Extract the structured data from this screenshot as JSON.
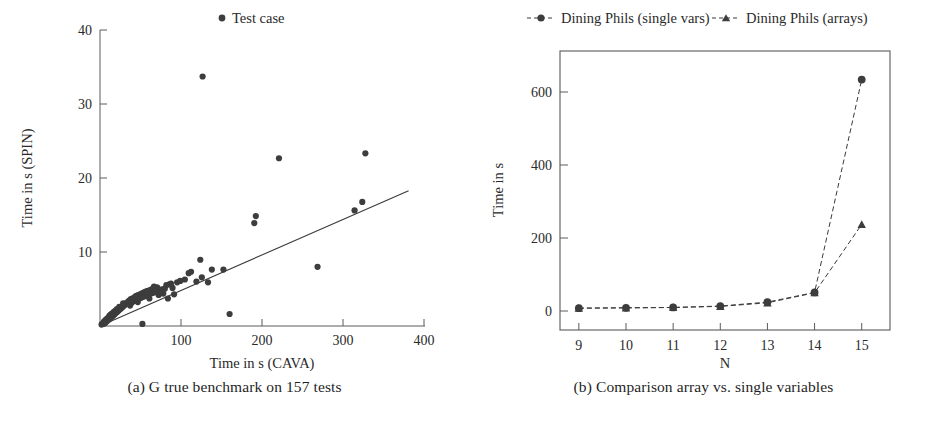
{
  "figure": {
    "subfigures": [
      {
        "caption": "(a) G true benchmark on 157 tests",
        "caption_tag": "(a)"
      },
      {
        "caption": "(b) Comparison array vs. single variables",
        "caption_tag": "(b)"
      }
    ]
  },
  "chart_data": [
    {
      "type": "scatter",
      "title": "",
      "xlabel": "Time in s (CAVA)",
      "ylabel": "Time in s (SPIN)",
      "xlim": [
        0,
        420
      ],
      "ylim": [
        0,
        42
      ],
      "xticks": [
        100,
        200,
        300,
        400
      ],
      "yticks": [
        10,
        20,
        30,
        40
      ],
      "grid": false,
      "legend_position": "top-center",
      "legend": [
        {
          "label": "Test case",
          "marker": "circle",
          "color": "#3d3d3d"
        }
      ],
      "trend_line": {
        "label": "regression line",
        "x": [
          0,
          400
        ],
        "y": [
          0,
          19.2
        ],
        "color": "#3a3a3a"
      },
      "series": [
        {
          "name": "Test case",
          "marker": "circle",
          "color": "#3d3d3d",
          "points": [
            [
              2,
              0.2
            ],
            [
              3,
              0.3
            ],
            [
              4,
              0.3
            ],
            [
              5,
              0.4
            ],
            [
              5,
              0.6
            ],
            [
              6,
              0.4
            ],
            [
              6,
              0.7
            ],
            [
              7,
              0.5
            ],
            [
              7,
              0.8
            ],
            [
              8,
              0.6
            ],
            [
              8,
              0.9
            ],
            [
              9,
              0.7
            ],
            [
              9,
              1.0
            ],
            [
              10,
              0.8
            ],
            [
              10,
              1.1
            ],
            [
              11,
              0.9
            ],
            [
              11,
              1.2
            ],
            [
              12,
              1.0
            ],
            [
              12,
              1.4
            ],
            [
              13,
              1.1
            ],
            [
              13,
              1.5
            ],
            [
              14,
              1.2
            ],
            [
              14,
              1.6
            ],
            [
              15,
              1.3
            ],
            [
              15,
              1.7
            ],
            [
              16,
              1.4
            ],
            [
              16,
              1.8
            ],
            [
              17,
              1.5
            ],
            [
              18,
              1.6
            ],
            [
              18,
              2.0
            ],
            [
              19,
              1.7
            ],
            [
              20,
              1.8
            ],
            [
              20,
              2.2
            ],
            [
              21,
              1.9
            ],
            [
              22,
              2.0
            ],
            [
              22,
              2.4
            ],
            [
              23,
              2.1
            ],
            [
              24,
              2.2
            ],
            [
              25,
              2.3
            ],
            [
              25,
              2.7
            ],
            [
              26,
              2.4
            ],
            [
              27,
              2.5
            ],
            [
              28,
              2.6
            ],
            [
              29,
              2.7
            ],
            [
              30,
              2.8
            ],
            [
              30,
              3.2
            ],
            [
              31,
              2.9
            ],
            [
              32,
              3.0
            ],
            [
              33,
              3.1
            ],
            [
              34,
              3.2
            ],
            [
              35,
              3.3
            ],
            [
              36,
              3.4
            ],
            [
              37,
              3.5
            ],
            [
              38,
              3.6
            ],
            [
              39,
              2.9
            ],
            [
              40,
              3.8
            ],
            [
              41,
              3.3
            ],
            [
              42,
              3.9
            ],
            [
              43,
              3.5
            ],
            [
              44,
              4.0
            ],
            [
              45,
              3.6
            ],
            [
              46,
              4.2
            ],
            [
              47,
              3.8
            ],
            [
              48,
              4.3
            ],
            [
              49,
              3.4
            ],
            [
              50,
              4.4
            ],
            [
              51,
              3.9
            ],
            [
              52,
              4.5
            ],
            [
              53,
              4.0
            ],
            [
              54,
              4.6
            ],
            [
              55,
              4.1
            ],
            [
              56,
              4.7
            ],
            [
              57,
              4.2
            ],
            [
              58,
              4.8
            ],
            [
              59,
              4.3
            ],
            [
              60,
              4.9
            ],
            [
              61,
              4.4
            ],
            [
              62,
              5.0
            ],
            [
              63,
              4.5
            ],
            [
              64,
              3.9
            ],
            [
              65,
              5.1
            ],
            [
              66,
              4.6
            ],
            [
              67,
              5.2
            ],
            [
              68,
              4.7
            ],
            [
              69,
              5.3
            ],
            [
              70,
              5.6
            ],
            [
              71,
              4.8
            ],
            [
              72,
              5.4
            ],
            [
              73,
              4.9
            ],
            [
              74,
              5.5
            ],
            [
              75,
              5.0
            ],
            [
              76,
              4.4
            ],
            [
              78,
              5.1
            ],
            [
              80,
              5.2
            ],
            [
              82,
              4.6
            ],
            [
              84,
              5.3
            ],
            [
              86,
              5.8
            ],
            [
              88,
              3.9
            ],
            [
              90,
              5.9
            ],
            [
              92,
              6.0
            ],
            [
              94,
              5.4
            ],
            [
              96,
              4.5
            ],
            [
              55,
              0.3
            ],
            [
              100,
              6.2
            ],
            [
              104,
              6.4
            ],
            [
              110,
              6.6
            ],
            [
              115,
              7.5
            ],
            [
              118,
              7.7
            ],
            [
              125,
              6.3
            ],
            [
              130,
              9.4
            ],
            [
              132,
              6.9
            ],
            [
              140,
              6.2
            ],
            [
              145,
              8.0
            ],
            [
              160,
              8.0
            ],
            [
              168,
              1.7
            ],
            [
              200,
              14.6
            ],
            [
              202,
              15.6
            ],
            [
              232,
              23.8
            ],
            [
              282,
              8.4
            ],
            [
              330,
              16.4
            ],
            [
              340,
              17.6
            ],
            [
              344,
              24.5
            ],
            [
              133,
              35.4
            ]
          ]
        }
      ]
    },
    {
      "type": "line",
      "title": "",
      "xlabel": "N",
      "ylabel": "Time in s",
      "x": [
        9,
        10,
        11,
        12,
        13,
        14,
        15
      ],
      "xticks": [
        9,
        10,
        11,
        12,
        13,
        14,
        15
      ],
      "yticks": [
        0,
        200,
        400,
        600
      ],
      "xlim": [
        8.6,
        15.6
      ],
      "ylim": [
        -60,
        720
      ],
      "grid": false,
      "legend_position": "top-center",
      "series": [
        {
          "name": "Dining Phils (single vars)",
          "marker": "circle",
          "color": "#3d3d3d",
          "values": [
            1,
            2,
            3,
            7,
            18,
            45,
            640
          ]
        },
        {
          "name": "Dining Phils (arrays)",
          "marker": "triangle",
          "color": "#3d3d3d",
          "values": [
            1,
            2,
            3,
            6,
            16,
            44,
            235
          ]
        }
      ]
    }
  ]
}
